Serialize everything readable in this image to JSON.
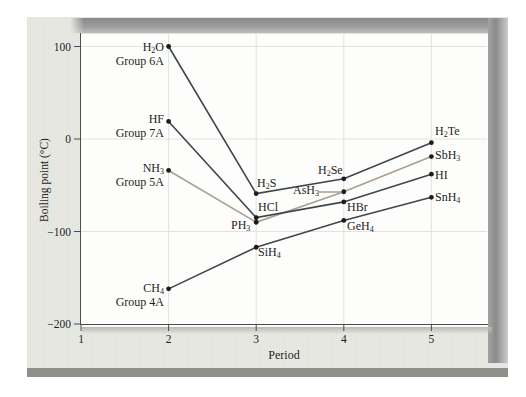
{
  "figure": {
    "background": "#ffffff",
    "panel_color": "#e8e8e3",
    "frame_bar_color": "#8f908b",
    "y_axis_title": "Boiling point (°C)",
    "x_axis_title": "Period"
  },
  "chart_data": {
    "type": "line",
    "title": "",
    "xlabel": "Period",
    "ylabel": "Boiling point (°C)",
    "xlim": [
      1,
      5.65
    ],
    "ylim": [
      -210,
      115
    ],
    "grid": true,
    "x_ticks": [
      1,
      2,
      3,
      4,
      5
    ],
    "x_tick_labels": [
      "1",
      "2",
      "3",
      "4",
      "5"
    ],
    "y_ticks": [
      100,
      0,
      -100,
      -200
    ],
    "y_tick_labels": [
      "100",
      "0",
      "−100",
      "−200"
    ],
    "grid_color": "#e3e2dc",
    "axis_color": "#4d4d4d",
    "point_color": "#1c1c1c",
    "series": [
      {
        "name": "Group 6A hydrides",
        "color": "#3f4650",
        "points": [
          [
            "H2O",
            2,
            100
          ],
          [
            "H2S",
            3,
            -59
          ],
          [
            "H2Se",
            4,
            -43
          ],
          [
            "H2Te",
            5,
            -4
          ]
        ]
      },
      {
        "name": "Group 7A hydrides",
        "color": "#3f4650",
        "points": [
          [
            "HF",
            2,
            19
          ],
          [
            "HCl",
            3,
            -85
          ],
          [
            "HBr",
            4,
            -68
          ],
          [
            "HI",
            5,
            -38
          ]
        ]
      },
      {
        "name": "Group 5A hydrides",
        "color": "#ab9f94",
        "points": [
          [
            "NH3",
            2,
            -34
          ],
          [
            "PH3",
            3,
            -90
          ],
          [
            "AsH3",
            4,
            -57
          ],
          [
            "SbH3",
            5,
            -19
          ]
        ]
      },
      {
        "name": "Group 4A hydrides",
        "color": "#3f4650",
        "points": [
          [
            "CH4",
            2,
            -162
          ],
          [
            "SiH4",
            3,
            -117
          ],
          [
            "GeH4",
            4,
            -88
          ],
          [
            "SnH4",
            5,
            -63
          ]
        ]
      }
    ]
  },
  "annotations": {
    "labels": [
      {
        "text": "H2O",
        "formula": true,
        "x": 164,
        "y": 41,
        "align": "right"
      },
      {
        "text": "Group 6A",
        "formula": false,
        "x": 164,
        "y": 55,
        "align": "right"
      },
      {
        "text": "HF",
        "formula": true,
        "x": 164,
        "y": 113,
        "align": "right"
      },
      {
        "text": "Group 7A",
        "formula": false,
        "x": 164,
        "y": 127,
        "align": "right"
      },
      {
        "text": "NH3",
        "formula": true,
        "x": 164,
        "y": 162,
        "align": "right"
      },
      {
        "text": "Group 5A",
        "formula": false,
        "x": 164,
        "y": 176,
        "align": "right"
      },
      {
        "text": "CH4",
        "formula": true,
        "x": 164,
        "y": 282,
        "align": "right"
      },
      {
        "text": "Group 4A",
        "formula": false,
        "x": 164,
        "y": 296,
        "align": "right"
      },
      {
        "text": "H2S",
        "formula": true,
        "x": 257,
        "y": 177,
        "align": "left"
      },
      {
        "text": "HCl",
        "formula": true,
        "x": 258,
        "y": 201,
        "align": "left"
      },
      {
        "text": "PH3",
        "formula": true,
        "x": 231,
        "y": 219,
        "align": "left"
      },
      {
        "text": "SiH4",
        "formula": true,
        "x": 258,
        "y": 246,
        "align": "left"
      },
      {
        "text": "H2Se",
        "formula": true,
        "x": 318,
        "y": 164,
        "align": "left"
      },
      {
        "text": "AsH3",
        "formula": true,
        "x": 293,
        "y": 184,
        "align": "left"
      },
      {
        "text": "HBr",
        "formula": true,
        "x": 347,
        "y": 201,
        "align": "left"
      },
      {
        "text": "GeH4",
        "formula": true,
        "x": 347,
        "y": 220,
        "align": "left"
      },
      {
        "text": "H2Te",
        "formula": true,
        "x": 435,
        "y": 125,
        "align": "left"
      },
      {
        "text": "SbH3",
        "formula": true,
        "x": 435,
        "y": 149,
        "align": "left"
      },
      {
        "text": "HI",
        "formula": true,
        "x": 435,
        "y": 169,
        "align": "left"
      },
      {
        "text": "SnH4",
        "formula": true,
        "x": 435,
        "y": 191,
        "align": "left"
      }
    ],
    "leader_line": {
      "x1": 319,
      "y1": 192,
      "x2": 341,
      "y2": 192,
      "color": "#707070"
    }
  }
}
